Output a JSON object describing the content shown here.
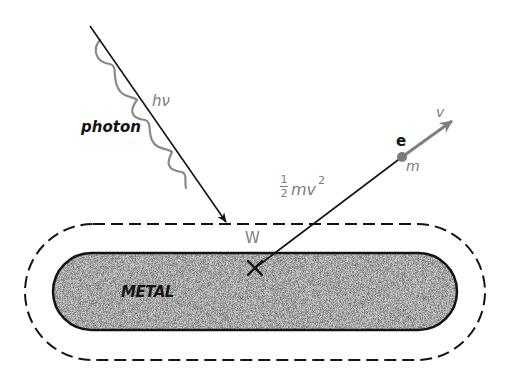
{
  "diagram": {
    "labels": {
      "photon": "photon",
      "energy": "hν",
      "work_function": "W",
      "kinetic_energy_num": "1",
      "kinetic_energy_den": "2",
      "kinetic_energy_rest": "mv",
      "kinetic_energy_exp": "2",
      "electron": "e",
      "mass": "m",
      "velocity": "v",
      "metal": "METAL"
    },
    "colors": {
      "line": "#141414",
      "label_gray": "#7d7d7d",
      "metal_fill": "#c9c9c9"
    },
    "elements": {
      "photon_ray": {
        "from": [
          92,
          28
        ],
        "to": [
          226,
          222
        ]
      },
      "emission_point": [
        255,
        268
      ],
      "electron_path": {
        "from": [
          255,
          268
        ],
        "to": [
          402,
          157
        ]
      },
      "velocity_arrow": {
        "from": [
          402,
          157
        ],
        "to": [
          452,
          121
        ]
      },
      "metal_slab": {
        "x": 53,
        "y": 253,
        "width": 404,
        "height": 77
      },
      "surface_boundary": {
        "x": 25,
        "y": 224,
        "width": 460,
        "height": 136,
        "style": "dashed"
      }
    }
  }
}
